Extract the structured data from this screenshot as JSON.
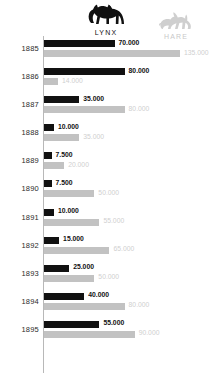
{
  "legend": {
    "lynx": {
      "label": "LYNX",
      "icon": "lynx-icon",
      "color": "#111111"
    },
    "hare": {
      "label": "HARE",
      "icon": "hare-icon",
      "color": "#c2c2c2"
    }
  },
  "chart_data": {
    "type": "bar",
    "title": "",
    "xlabel": "",
    "ylabel": "",
    "grid": false,
    "legend_position": "top",
    "orientation": "horizontal",
    "categories": [
      "1885",
      "1886",
      "1887",
      "1888",
      "1889",
      "1890",
      "1891",
      "1892",
      "1893",
      "1894",
      "1895"
    ],
    "xlim": [
      0,
      135000
    ],
    "series": [
      {
        "name": "LYNX",
        "color": "#111111",
        "values": [
          70000,
          80000,
          35000,
          10000,
          7500,
          7500,
          10000,
          15000,
          25000,
          40000,
          55000
        ],
        "labels": [
          "70.000",
          "80.000",
          "35.000",
          "10.000",
          "7.500",
          "7.500",
          "10.000",
          "15.000",
          "25.000",
          "40.000",
          "55.000"
        ]
      },
      {
        "name": "HARE",
        "color": "#c2c2c2",
        "values": [
          135000,
          14000,
          80000,
          35000,
          20000,
          50000,
          55000,
          65000,
          50000,
          80000,
          90000
        ],
        "labels": [
          "135.000",
          "14.000",
          "80.000",
          "35.000",
          "20.000",
          "50.000",
          "55.000",
          "65.000",
          "50.000",
          "80.000",
          "90.000"
        ]
      }
    ]
  }
}
